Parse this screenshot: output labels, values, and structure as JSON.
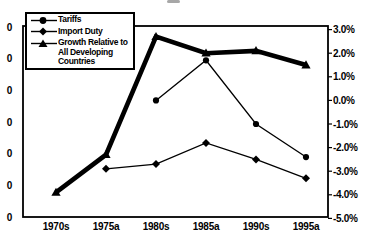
{
  "colors": {
    "line": "#000000",
    "text": "#000000",
    "background": "#ffffff"
  },
  "legend": {
    "items": [
      {
        "label": "Tariffs",
        "marker": "circle"
      },
      {
        "label": "Import Duty",
        "marker": "diamond"
      },
      {
        "label": "Growth Relative to All Developing Countries",
        "marker": "triangle"
      }
    ]
  },
  "chart_data": {
    "type": "line",
    "categories": [
      "1970s",
      "1975a",
      "1980s",
      "1985a",
      "1990s",
      "1995a"
    ],
    "series": [
      {
        "name": "Tariffs",
        "marker": "circle",
        "line_width": 1.3,
        "values": [
          null,
          null,
          0.0,
          1.7,
          -1.0,
          -2.4
        ]
      },
      {
        "name": "Import Duty",
        "marker": "diamond",
        "line_width": 1.3,
        "values": [
          null,
          -2.9,
          -2.7,
          -1.8,
          -2.5,
          -3.3
        ]
      },
      {
        "name": "Growth Relative to All Developing Countries",
        "marker": "triangle",
        "line_width": 4.6,
        "values": [
          -3.9,
          -2.3,
          2.7,
          2.0,
          2.1,
          1.5
        ]
      }
    ],
    "left_axis": {
      "labels": [
        "0",
        "0",
        "0",
        "0",
        "0",
        "0",
        "0"
      ]
    },
    "right_axis": {
      "labels": [
        "3.0%",
        "2.0%",
        "1.0%",
        "0.0%",
        "-1.0%",
        "-2.0%",
        "-3.0%",
        "-4.0%",
        "-5.0%"
      ],
      "max": 3.0,
      "min": -5.0,
      "step": 1.0
    },
    "grid": false,
    "legend_position": "top-left",
    "title": ""
  }
}
